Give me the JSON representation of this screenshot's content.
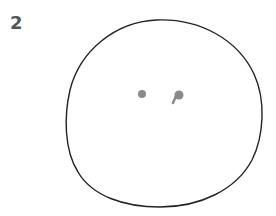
{
  "figure": {
    "label": "2",
    "colors": {
      "outline": "#222222",
      "marks": "#8a8a8a",
      "label": "#555555"
    },
    "shapes": [
      {
        "type": "circle-outline",
        "cx": 164,
        "cy": 114,
        "rx": 98,
        "ry": 94
      },
      {
        "type": "dot",
        "cx": 142,
        "cy": 94,
        "r": 4
      },
      {
        "type": "p-shaped-mark",
        "cx": 178,
        "cy": 95
      }
    ]
  }
}
